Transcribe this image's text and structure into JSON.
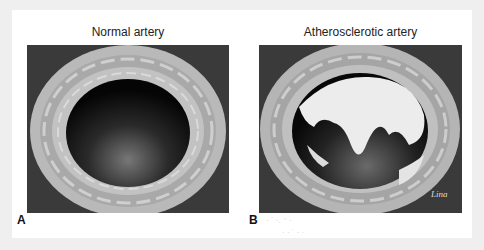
{
  "figure": {
    "panels": [
      {
        "letter": "A",
        "title": "Normal artery",
        "lumen": "open"
      },
      {
        "letter": "B",
        "title": "Atherosclerotic artery",
        "lumen": "plaque-occluded",
        "signature": "Lina"
      }
    ],
    "faint_text": [
      "· ˙ ·. ⁻ ·",
      "· · ˙ ·  ·"
    ]
  }
}
